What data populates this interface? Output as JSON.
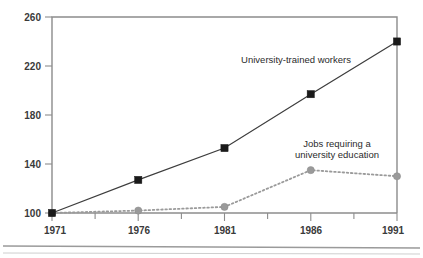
{
  "chart_data": {
    "type": "line",
    "title": "",
    "subtitle": "",
    "xlabel": "",
    "ylabel": "",
    "x": [
      1971,
      1976,
      1981,
      1986,
      1991
    ],
    "categories": [
      "1971",
      "1976",
      "1981",
      "1986",
      "1991"
    ],
    "xlim": [
      1971,
      1991
    ],
    "ylim": [
      100,
      260
    ],
    "yticks": [
      100,
      140,
      180,
      220,
      260
    ],
    "ytick_labels": [
      "100",
      "140",
      "180",
      "220",
      "260"
    ],
    "xticks": [
      1971,
      1976,
      1981,
      1986,
      1991
    ],
    "xtick_labels": [
      "1971",
      "1976",
      "1981",
      "1986",
      "1991"
    ],
    "grid": false,
    "legend_position": "inline-annotations",
    "series": [
      {
        "name": "University-trained workers",
        "values": [
          100,
          127,
          153,
          197,
          240
        ],
        "marker": "square",
        "marker_color": "#1a1a1a",
        "line_style": "solid",
        "line_color": "#3d3d3d"
      },
      {
        "name": "Jobs requiring a university education",
        "values": [
          100,
          102,
          105,
          135,
          130
        ],
        "marker": "circle",
        "marker_color": "#9a9a9a",
        "line_style": "dotted",
        "line_color": "#9a9a9a"
      }
    ],
    "annotations": [
      {
        "id": "annot-university-trained-workers",
        "text": "University-trained workers",
        "lines": [
          "University-trained workers"
        ],
        "x": 1983.4,
        "y": 223
      },
      {
        "id": "annot-jobs-requiring",
        "text": "Jobs requiring a university education",
        "lines": [
          "Jobs requiring a",
          "university education"
        ],
        "x": 1988.2,
        "y": 158
      }
    ]
  },
  "axis": {
    "ytick_0": "100",
    "ytick_1": "140",
    "ytick_2": "180",
    "ytick_3": "220",
    "ytick_4": "260",
    "xtick_0": "1971",
    "xtick_1": "1976",
    "xtick_2": "1981",
    "xtick_3": "1986",
    "xtick_4": "1991"
  },
  "annotations": {
    "series_a_label": "University-trained workers",
    "series_b_line_1": "Jobs requiring a",
    "series_b_line_2": "university education"
  },
  "colors": {
    "series_a": "#1a1a1a",
    "series_b": "#9a9a9a",
    "axis": "#8c8c8c",
    "text": "#2b2b2b",
    "background": "#ffffff"
  }
}
